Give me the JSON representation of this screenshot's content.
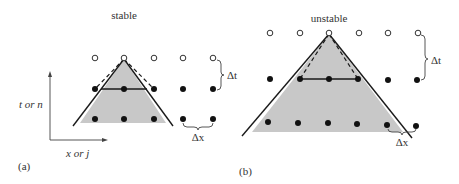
{
  "panels": [
    {
      "id": "a",
      "label": "(a)",
      "title": "stable",
      "axis_y_label": "t or n",
      "axis_x_label": "x or j",
      "dt_label": "Δt",
      "dx_label": "Δx"
    },
    {
      "id": "b",
      "label": "(b)",
      "title": "unstable",
      "dt_label": "Δt",
      "dx_label": "Δx"
    }
  ],
  "colors": {
    "shade": "#c8c8c8",
    "line": "#1a1a1a",
    "dot": "#111111",
    "text": "#333333"
  }
}
